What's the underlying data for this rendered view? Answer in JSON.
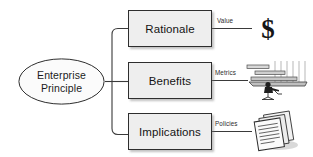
{
  "diagram": {
    "root": {
      "label": "Enterprise\nPrinciple",
      "shape": "ellipse"
    },
    "branches": [
      {
        "label": "Rationale",
        "edge_label": "Value",
        "icon": "dollar-sign-icon"
      },
      {
        "label": "Benefits",
        "edge_label": "Metrics",
        "icon": "gantt-chart-workstation-icon"
      },
      {
        "label": "Implications",
        "edge_label": "Policies",
        "icon": "stacked-documents-icon"
      }
    ],
    "icon_glyphs": {
      "dollar": "$"
    },
    "colors": {
      "background": "#ffffff",
      "box_fill": "#eeeeee",
      "box_border": "#2e2e2e",
      "connector": "#3a3a3a",
      "text": "#141414"
    }
  }
}
